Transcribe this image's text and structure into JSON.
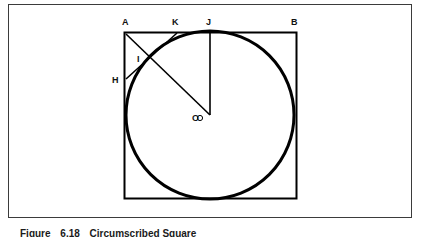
{
  "figure": {
    "caption_label": "Figure",
    "caption_number": "6.18",
    "caption_title": "Circumscribed Square",
    "stroke_color": "#000000",
    "frame_color": "#3b3b3b",
    "background_color": "#ffffff"
  },
  "labels": {
    "a": "A",
    "b": "B",
    "h": "H",
    "i": "I",
    "j": "J",
    "k": "K",
    "o": "O"
  },
  "geometry": {
    "square": {
      "left": 124,
      "top": 32,
      "right": 297,
      "bottom": 199
    },
    "circle": {
      "cx": 210,
      "cy": 115,
      "r": 84
    },
    "segments": [
      {
        "name": "a-to-o",
        "x1": 126,
        "y1": 34,
        "x2": 210,
        "y2": 115
      },
      {
        "name": "h-to-k",
        "x1": 126,
        "y1": 79,
        "x2": 177,
        "y2": 33
      },
      {
        "name": "j-to-o",
        "x1": 210,
        "y1": 33,
        "x2": 210,
        "y2": 115
      }
    ],
    "points": {
      "a": {
        "x": 126,
        "y": 34
      },
      "b": {
        "x": 296,
        "y": 34
      },
      "h": {
        "x": 126,
        "y": 79
      },
      "i": {
        "x": 140,
        "y": 62
      },
      "j": {
        "x": 210,
        "y": 33
      },
      "k": {
        "x": 177,
        "y": 33
      },
      "o": {
        "x": 210,
        "y": 115
      }
    }
  }
}
